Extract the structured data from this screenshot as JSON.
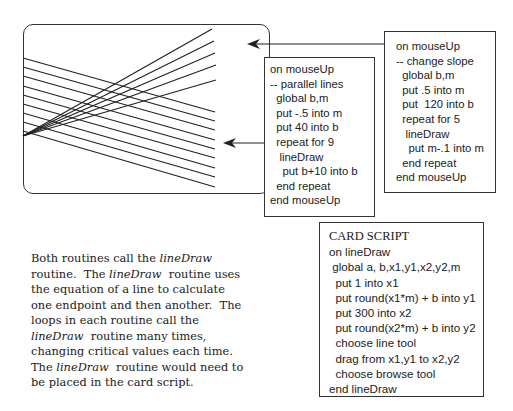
{
  "card": {
    "parallel_lines": {
      "count": 9,
      "slope": -0.5,
      "start_b": 40,
      "step_b": 10,
      "left_y": [
        58,
        67,
        76,
        86,
        95,
        104,
        113,
        122,
        131
      ],
      "right_y": [
        112,
        121,
        130,
        140,
        149,
        158,
        168,
        177,
        187
      ],
      "x_start": 23,
      "x_end": 215
    },
    "slope_lines": {
      "count": 5,
      "origin_y": 136,
      "x_start": 23,
      "x_end": [
        212,
        214,
        215,
        216,
        216
      ],
      "end_y": [
        29,
        41,
        53,
        65,
        80
      ]
    }
  },
  "arrows": [
    {
      "name": "arrow-to-card-top",
      "from_x": 384,
      "to_x": 247,
      "y": 44
    },
    {
      "name": "arrow-to-card-middle",
      "from_x": 264,
      "to_x": 223,
      "y": 143
    }
  ],
  "scripts": {
    "parallel": {
      "lines": [
        "on mouseUp",
        "-- parallel lines",
        "  global b,m",
        "  put -.5 into m",
        "  put 40 into b",
        "  repeat for 9",
        "   lineDraw",
        "    put b+10 into b",
        "  end repeat",
        "end mouseUp"
      ]
    },
    "slope": {
      "lines": [
        "on mouseUp",
        "-- change slope",
        "  global b,m",
        "  put .5 into m",
        "  put  120 into b",
        "  repeat for 5",
        "   lineDraw",
        "    put m-.1 into m",
        "  end repeat",
        "end mouseUp"
      ]
    },
    "card_script": {
      "title": "CARD SCRIPT",
      "lines": [
        "on lineDraw",
        " global a, b,x1,y1,x2,y2,m",
        "  put 1 into x1",
        "  put round(x1*m) + b into y1",
        "  put 300 into x2",
        "  put round(x2*m) + b into y2",
        "  choose line tool",
        "  drag from x1,y1 to x2,y2",
        "  choose browse tool",
        "end lineDraw"
      ]
    }
  },
  "description": {
    "lines": [
      [
        {
          "t": "Both routines call the "
        },
        {
          "t": "lineDraw",
          "i": true
        }
      ],
      [
        {
          "t": "routine.  The "
        },
        {
          "t": "lineDraw",
          "i": true
        },
        {
          "t": "  routine uses"
        }
      ],
      [
        {
          "t": "the equation of a line to calculate"
        }
      ],
      [
        {
          "t": "one endpoint and then another.  The"
        }
      ],
      [
        {
          "t": "loops in each routine call the"
        }
      ],
      [
        {
          "t": "lineDraw",
          "i": true
        },
        {
          "t": "  routine many times,"
        }
      ],
      [
        {
          "t": "changing critical values each time."
        }
      ],
      [
        {
          "t": "The "
        },
        {
          "t": "lineDraw",
          "i": true
        },
        {
          "t": "  routine would need to"
        }
      ],
      [
        {
          "t": "be placed in the card script."
        }
      ]
    ]
  },
  "colors": {
    "ink": "#222222",
    "border": "#333333",
    "background": "#ffffff"
  }
}
